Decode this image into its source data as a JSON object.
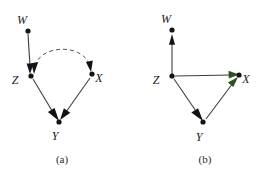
{
  "figure": {
    "background_color": "#ffffff",
    "panels": [
      {
        "id": "a",
        "caption": "(a)",
        "nodes": [
          {
            "id": "W",
            "label": "W",
            "x": 28,
            "y": 31,
            "label_x": 22,
            "label_y": 24
          },
          {
            "id": "Z",
            "label": "Z",
            "x": 31,
            "y": 76,
            "label_x": 15,
            "label_y": 84
          },
          {
            "id": "X",
            "label": "X",
            "x": 92,
            "y": 74,
            "label_x": 99,
            "label_y": 82
          },
          {
            "id": "Y",
            "label": "Y",
            "x": 59,
            "y": 122,
            "label_x": 55,
            "label_y": 140
          }
        ],
        "edges": [
          {
            "from": "W",
            "to": "Z",
            "style": "solid",
            "arrow": "single",
            "arrow_color": "#121218"
          },
          {
            "from": "Z",
            "to": "X",
            "style": "dashed",
            "arrow": "double",
            "arrow_color": "#121218"
          },
          {
            "from": "Z",
            "to": "Y",
            "style": "solid",
            "arrow": "single",
            "arrow_color": "#121218"
          },
          {
            "from": "X",
            "to": "Y",
            "style": "solid",
            "arrow": "single",
            "arrow_color": "#121218"
          }
        ]
      },
      {
        "id": "b",
        "caption": "(b)",
        "nodes": [
          {
            "id": "W",
            "label": "W",
            "x": 43,
            "y": 30,
            "label_x": 37,
            "label_y": 23
          },
          {
            "id": "Z",
            "label": "Z",
            "x": 43,
            "y": 76,
            "label_x": 27,
            "label_y": 84
          },
          {
            "id": "X",
            "label": "X",
            "x": 110,
            "y": 75,
            "label_x": 117,
            "label_y": 83
          },
          {
            "id": "Y",
            "label": "Y",
            "x": 74,
            "y": 122,
            "label_x": 70,
            "label_y": 141
          }
        ],
        "edges": [
          {
            "from": "Z",
            "to": "W",
            "style": "solid",
            "arrow": "single",
            "arrow_color": "#121218"
          },
          {
            "from": "Z",
            "to": "X",
            "style": "solid",
            "arrow": "single",
            "arrow_color": "#2f4f1e"
          },
          {
            "from": "Z",
            "to": "Y",
            "style": "solid",
            "arrow": "single",
            "arrow_color": "#121218"
          },
          {
            "from": "Y",
            "to": "X",
            "style": "solid",
            "arrow": "single",
            "arrow_color": "#2f4f1e"
          }
        ]
      }
    ]
  }
}
